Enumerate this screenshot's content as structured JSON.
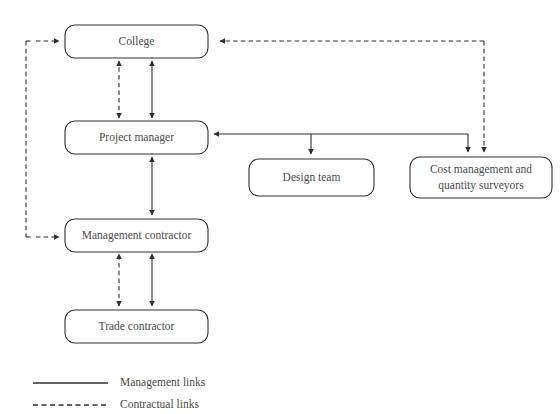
{
  "diagram": {
    "nodes": [
      {
        "id": "college",
        "label": "College"
      },
      {
        "id": "project-manager",
        "label": "Project manager"
      },
      {
        "id": "design-team",
        "label": "Design team"
      },
      {
        "id": "cost-management",
        "label_line1": "Cost management and",
        "label_line2": "quantity surveyors"
      },
      {
        "id": "management-contractor",
        "label": "Management contractor"
      },
      {
        "id": "trade-contractor",
        "label": "Trade contractor"
      }
    ],
    "legend": {
      "items": [
        {
          "id": "management-links",
          "label": "Management links",
          "style": "solid"
        },
        {
          "id": "contractual-links",
          "label": "Contractual links",
          "style": "dashed"
        }
      ]
    },
    "colors": {
      "stroke": "#2f2f2f",
      "text": "#4a4a4a",
      "background": "#ffffff"
    }
  }
}
